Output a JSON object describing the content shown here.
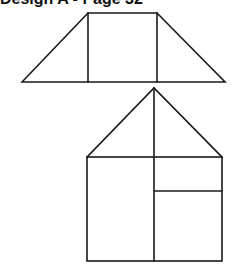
{
  "heading": "Design A - Page 32",
  "figure": {
    "stroke_color": "#1a1a1a",
    "shapes": [
      {
        "name": "trapezoid",
        "description": "Trapezoid divided into a center rectangle and two side triangles",
        "outline": [
          [
            22,
            82
          ],
          [
            88,
            13
          ],
          [
            157,
            13
          ],
          [
            225,
            82
          ]
        ],
        "dividers": [
          [
            [
              88,
              13
            ],
            [
              88,
              82
            ]
          ],
          [
            [
              157,
              13
            ],
            [
              157,
              82
            ]
          ]
        ]
      },
      {
        "name": "house",
        "description": "Square with triangular roof; roof split by a vertical from apex; square split vertically with the right half divided horizontally",
        "roof": [
          [
            87,
            157
          ],
          [
            154,
            88
          ],
          [
            222,
            157
          ]
        ],
        "body": {
          "x": 87,
          "y": 157,
          "width": 135,
          "height": 104
        },
        "dividers": [
          [
            [
              154,
              88
            ],
            [
              154,
              261
            ]
          ],
          [
            [
              154,
              191
            ],
            [
              222,
              191
            ]
          ]
        ]
      }
    ]
  }
}
